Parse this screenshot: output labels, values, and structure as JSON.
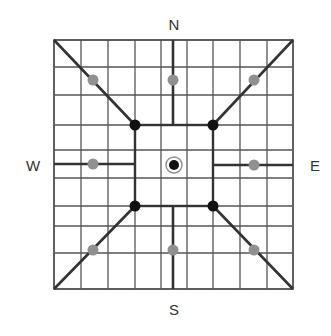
{
  "compass": {
    "north": "N",
    "south": "S",
    "west": "W",
    "east": "E"
  },
  "label_positions": {
    "north": [
      174,
      24
    ],
    "south": [
      174,
      309
    ],
    "west": [
      33,
      165
    ],
    "east": [
      315,
      165
    ]
  },
  "colors": {
    "grid": "#555555",
    "thick": "#333333",
    "black_dot": "#111111",
    "gray_dot": "#909090",
    "label": "#333333"
  },
  "grid": {
    "left": 54,
    "top": 40,
    "right": 293,
    "bottom": 289,
    "verticals": [
      54,
      81,
      108,
      135,
      161,
      187,
      213,
      240,
      267,
      293
    ],
    "horizontals": [
      40,
      67,
      95,
      125,
      150,
      178,
      206,
      226,
      253,
      289
    ]
  },
  "inner_square": {
    "x1": 135,
    "y1": 125,
    "x2": 213,
    "y2": 206
  },
  "center": {
    "x": 174,
    "y": 165
  },
  "spokes": [
    {
      "name": "north",
      "x1": 173,
      "y1": 40,
      "x2": 173,
      "y2": 125
    },
    {
      "name": "south",
      "x1": 173,
      "y1": 206,
      "x2": 173,
      "y2": 289
    },
    {
      "name": "west",
      "x1": 54,
      "y1": 164,
      "x2": 135,
      "y2": 164
    },
    {
      "name": "east",
      "x1": 213,
      "y1": 165,
      "x2": 293,
      "y2": 165
    },
    {
      "name": "northwest",
      "x1": 54,
      "y1": 40,
      "x2": 135,
      "y2": 125
    },
    {
      "name": "northeast",
      "x1": 293,
      "y1": 40,
      "x2": 213,
      "y2": 125
    },
    {
      "name": "southwest",
      "x1": 54,
      "y1": 289,
      "x2": 135,
      "y2": 206
    },
    {
      "name": "southeast",
      "x1": 293,
      "y1": 289,
      "x2": 213,
      "y2": 206
    }
  ],
  "black_dots": [
    {
      "name": "nw-corner",
      "x": 135,
      "y": 125
    },
    {
      "name": "ne-corner",
      "x": 213,
      "y": 125
    },
    {
      "name": "sw-corner",
      "x": 135,
      "y": 206
    },
    {
      "name": "se-corner",
      "x": 213,
      "y": 206
    }
  ],
  "gray_dots": [
    {
      "name": "nw",
      "x": 93,
      "y": 80
    },
    {
      "name": "n",
      "x": 173,
      "y": 80
    },
    {
      "name": "ne",
      "x": 254,
      "y": 80
    },
    {
      "name": "w",
      "x": 93,
      "y": 164
    },
    {
      "name": "e",
      "x": 254,
      "y": 165
    },
    {
      "name": "sw",
      "x": 93,
      "y": 250
    },
    {
      "name": "s",
      "x": 173,
      "y": 250
    },
    {
      "name": "se",
      "x": 254,
      "y": 250
    }
  ]
}
